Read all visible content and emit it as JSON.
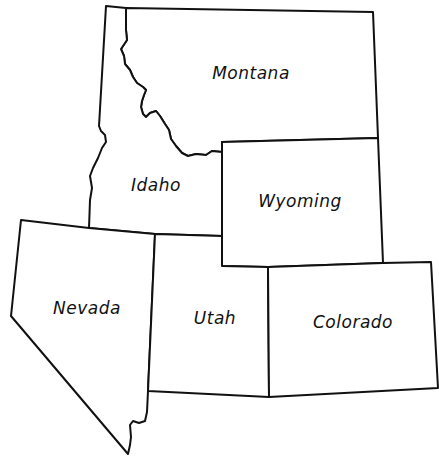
{
  "map": {
    "title": "Western United States",
    "stroke_color": "#111111",
    "fill_color": "#ffffff",
    "states": [
      {
        "name": "Montana",
        "label": "Montana"
      },
      {
        "name": "Idaho",
        "label": "Idaho"
      },
      {
        "name": "Wyoming",
        "label": "Wyoming"
      },
      {
        "name": "Nevada",
        "label": "Nevada"
      },
      {
        "name": "Utah",
        "label": "Utah"
      },
      {
        "name": "Colorado",
        "label": "Colorado"
      }
    ]
  }
}
